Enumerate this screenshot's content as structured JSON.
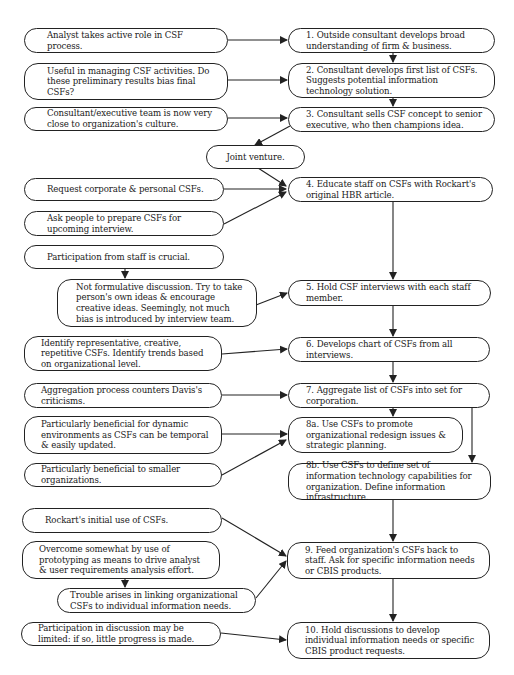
{
  "diagram": {
    "type": "flowchart",
    "colors": {
      "line": "#222222",
      "background": "#ffffff",
      "text": "#1a1a1a"
    },
    "steps": [
      {
        "id": "s1",
        "label": "1. Outside consultant develops broad understanding of firm & business."
      },
      {
        "id": "s2",
        "label": "2. Consultant develops first list of CSFs. Suggests potential information technology solution."
      },
      {
        "id": "s3",
        "label": "3. Consultant sells CSF concept to senior executive, who then champions idea."
      },
      {
        "id": "s4",
        "label": "4. Educate staff on CSFs with Rockart's original HBR article."
      },
      {
        "id": "s5",
        "label": "5. Hold CSF interviews with each staff member."
      },
      {
        "id": "s6",
        "label": "6. Develops chart of CSFs from all interviews."
      },
      {
        "id": "s7",
        "label": "7. Aggregate list of CSFs into set for corporation."
      },
      {
        "id": "s8a",
        "label": "8a. Use CSFs to promote organizational redesign issues & strategic planning."
      },
      {
        "id": "s8b",
        "label": "8b. Use CSFs to define set of information technology capabilities for organization. Define information infrastructure."
      },
      {
        "id": "s9",
        "label": "9. Feed organization's CSFs back to staff. Ask for specific information needs or CBIS products."
      },
      {
        "id": "s10",
        "label": "10. Hold discussions to develop individual information needs or specific CBIS product requests."
      }
    ],
    "notes": [
      {
        "id": "n1",
        "label": "Analyst takes active role in CSF process.",
        "target": "s1"
      },
      {
        "id": "n2",
        "label": "Useful in managing CSF activities. Do these preliminary results bias final CSFs?",
        "target": "s2"
      },
      {
        "id": "n3",
        "label": "Consultant/executive team is now very close to organization's culture.",
        "target": "s3"
      },
      {
        "id": "n4",
        "label": "Joint venture.",
        "target": "s4",
        "source": "s3"
      },
      {
        "id": "n5",
        "label": "Request corporate & personal CSFs.",
        "target": "s4"
      },
      {
        "id": "n6",
        "label": "Ask people to prepare CSFs for upcoming interview.",
        "target": "s4"
      },
      {
        "id": "n7",
        "label": "Participation from staff is crucial.",
        "target": "n8"
      },
      {
        "id": "n8",
        "label": "Not formulative discussion. Try to take person's own ideas & encourage creative ideas. Seemingly, not much bias is introduced by interview team.",
        "target": "s5"
      },
      {
        "id": "n9",
        "label": "Identify representative, creative, repetitive CSFs. Identify trends based on organizational level.",
        "target": "s6"
      },
      {
        "id": "n10",
        "label": "Aggregation process counters Davis's criticisms.",
        "target": "s7"
      },
      {
        "id": "n11",
        "label": "Particularly beneficial for dynamic environments as CSFs can be temporal & easily updated.",
        "target": "s8a"
      },
      {
        "id": "n12",
        "label": "Particularly beneficial to smaller organizations.",
        "target": "s8a"
      },
      {
        "id": "n13",
        "label": "Rockart's initial use of CSFs.",
        "target": "s9"
      },
      {
        "id": "n14",
        "label": "Overcome somewhat by use of prototyping as means to drive analyst & user requirements analysis effort.",
        "target": "n15"
      },
      {
        "id": "n15",
        "label": "Trouble arises in linking organizational CSFs to individual information needs.",
        "target": "s9"
      },
      {
        "id": "n16",
        "label": "Participation in discussion may be limited: if so, little progress is made.",
        "target": "s10"
      }
    ],
    "edges": [
      [
        "n1",
        "s1"
      ],
      [
        "n2",
        "s2"
      ],
      [
        "n3",
        "s3"
      ],
      [
        "s1",
        "s2"
      ],
      [
        "s2",
        "s3"
      ],
      [
        "s3",
        "n4"
      ],
      [
        "n4",
        "s4"
      ],
      [
        "n5",
        "s4"
      ],
      [
        "n6",
        "s4"
      ],
      [
        "n7",
        "n8"
      ],
      [
        "n8",
        "s5"
      ],
      [
        "s4",
        "s5"
      ],
      [
        "s5",
        "s6"
      ],
      [
        "n9",
        "s6"
      ],
      [
        "s6",
        "s7"
      ],
      [
        "n10",
        "s7"
      ],
      [
        "s7",
        "s8a"
      ],
      [
        "s7",
        "s8b"
      ],
      [
        "n11",
        "s8a"
      ],
      [
        "n12",
        "s8a"
      ],
      [
        "s8b",
        "s9"
      ],
      [
        "n13",
        "s9"
      ],
      [
        "n14",
        "n15"
      ],
      [
        "n15",
        "s9"
      ],
      [
        "s9",
        "s10"
      ],
      [
        "n16",
        "s10"
      ]
    ]
  }
}
